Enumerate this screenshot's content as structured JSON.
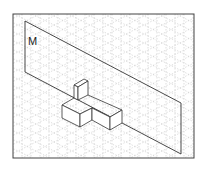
{
  "figure": {
    "plane_label": "M",
    "colors": {
      "frame": "#444444",
      "grid": "#c8c8c8",
      "lines": "#333333",
      "background": "#ffffff"
    }
  }
}
